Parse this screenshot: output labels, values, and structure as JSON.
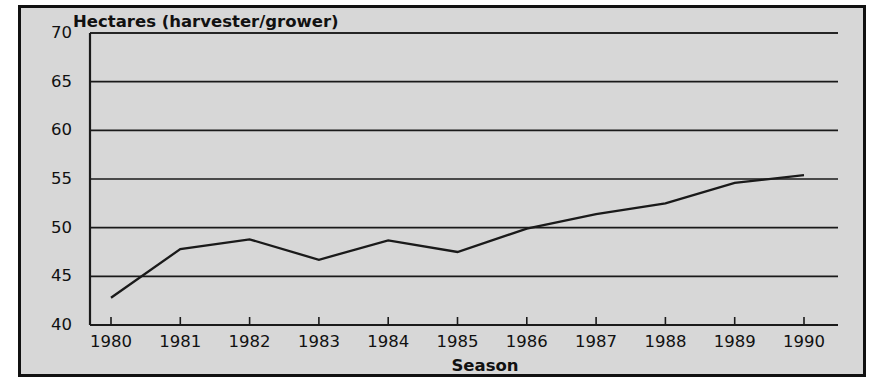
{
  "figure": {
    "background_color": "#d7d7d7",
    "frame_color": "#111111",
    "line_color": "#1a1a1a"
  },
  "chart_data": {
    "type": "line",
    "title": "Hectares (harvester/grower)",
    "xlabel": "Season",
    "ylabel": "",
    "categories": [
      "1980",
      "1981",
      "1982",
      "1983",
      "1984",
      "1985",
      "1986",
      "1987",
      "1988",
      "1989",
      "1990"
    ],
    "x": [
      1980,
      1981,
      1982,
      1983,
      1984,
      1985,
      1986,
      1987,
      1988,
      1989,
      1990
    ],
    "values": [
      42.8,
      47.8,
      48.8,
      46.7,
      48.7,
      47.5,
      49.9,
      51.4,
      52.5,
      54.6,
      55.4
    ],
    "series": [
      {
        "name": "Hectares (harvester/grower)",
        "values": [
          42.8,
          47.8,
          48.8,
          46.7,
          48.7,
          47.5,
          49.9,
          51.4,
          52.5,
          54.6,
          55.4
        ]
      }
    ],
    "ylim": [
      40,
      70
    ],
    "xlim": [
      1980,
      1990
    ],
    "yticks": [
      40,
      45,
      50,
      55,
      60,
      65,
      70
    ],
    "ytick_labels": [
      "40",
      "45",
      "50",
      "55",
      "60",
      "65",
      "70"
    ],
    "xtick_labels": [
      "1980",
      "1981",
      "1982",
      "1983",
      "1984",
      "1985",
      "1986",
      "1987",
      "1988",
      "1989",
      "1990"
    ],
    "grid": true,
    "grid_axis": "y",
    "legend": false,
    "legend_position": "none",
    "markers": false
  }
}
